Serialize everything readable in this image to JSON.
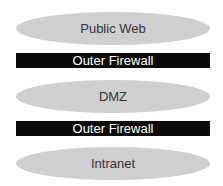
{
  "diagram": {
    "layers": [
      {
        "type": "zone",
        "label": "Public Web"
      },
      {
        "type": "firewall",
        "label": "Outer Firewall"
      },
      {
        "type": "zone",
        "label": "DMZ"
      },
      {
        "type": "firewall",
        "label": "Outer Firewall"
      },
      {
        "type": "zone",
        "label": "Intranet"
      }
    ],
    "colors": {
      "zone_fill": "#cfcfcf",
      "firewall_fill": "#0a0a0a",
      "firewall_text": "#ffffff"
    }
  }
}
